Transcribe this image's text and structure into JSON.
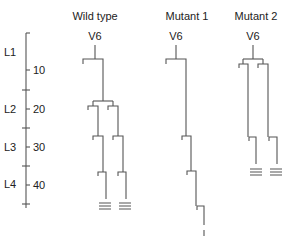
{
  "columns": [
    {
      "title": "Wild type",
      "root": "V6"
    },
    {
      "title": "Mutant 1",
      "root": "V6"
    },
    {
      "title": "Mutant 2",
      "root": "V6"
    }
  ],
  "axis": {
    "stages": [
      "L1",
      "L2",
      "L3",
      "L4"
    ],
    "ticks": [
      "10",
      "20",
      "30",
      "40"
    ]
  },
  "colors": {
    "line": "#555555",
    "text": "#222222",
    "background": "#ffffff"
  }
}
